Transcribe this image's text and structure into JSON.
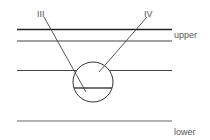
{
  "diagram": {
    "labels": {
      "pointer_left": "III",
      "pointer_right": "IV",
      "upper": "upper",
      "lower": "lower"
    },
    "colors": {
      "line": "#444444",
      "thick_line": "#222222",
      "label": "#555555",
      "background": "#ffffff"
    },
    "horizontal_lines": [
      {
        "name": "top-boundary-line",
        "y": 29.5,
        "x1": 17,
        "x2": 172,
        "width": 1.6
      },
      {
        "name": "upper-line",
        "y": 41,
        "x1": 17,
        "x2": 172,
        "width": 1
      },
      {
        "name": "middle-line",
        "y": 70.5,
        "x1": 17,
        "x2": 172,
        "width": 1
      },
      {
        "name": "lower-line",
        "y": 121,
        "x1": 17,
        "x2": 172,
        "width": 1
      }
    ],
    "circle": {
      "cx": 93,
      "cy": 82,
      "r": 20
    },
    "chord": {
      "y": 88,
      "x1": 74,
      "x2": 112
    },
    "pointers": [
      {
        "name": "pointer-III",
        "x1": 44,
        "y1": 17,
        "x2": 86,
        "y2": 92
      },
      {
        "name": "pointer-IV",
        "x1": 147,
        "y1": 17,
        "x2": 99,
        "y2": 72
      }
    ]
  }
}
